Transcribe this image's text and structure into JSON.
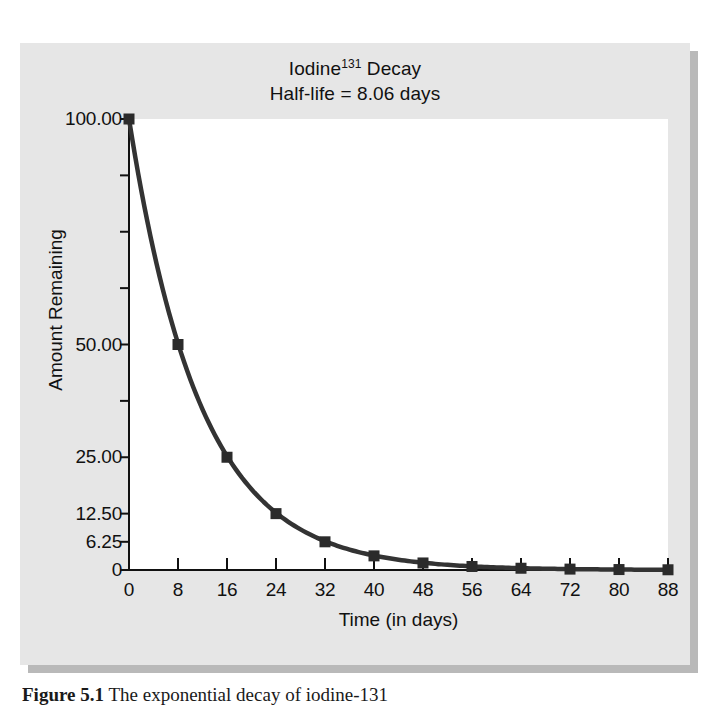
{
  "figure": {
    "caption_label": "Figure 5.1",
    "caption_text": "The exponential decay of iodine-131"
  },
  "chart_data": {
    "type": "line",
    "title": "Iodine131 Decay",
    "title_line1_base": "Iodine",
    "title_line1_sup": "131",
    "title_line1_tail": " Decay",
    "title_line2": "Half-life = 8.06 days",
    "xlabel": "Time (in days)",
    "ylabel": "Amount Remaining",
    "xlim": [
      0,
      88
    ],
    "ylim": [
      0,
      100
    ],
    "grid": false,
    "legend": "none",
    "marker": "square",
    "line_color": "#333333",
    "marker_color": "#2b2b2b",
    "background_color": "#ffffff",
    "panel_color": "#e6e6e6",
    "xticks": [
      0,
      8,
      16,
      24,
      32,
      40,
      48,
      56,
      64,
      72,
      80,
      88
    ],
    "xtick_labels": [
      "0",
      "8",
      "16",
      "24",
      "32",
      "40",
      "48",
      "56",
      "64",
      "72",
      "80",
      "88"
    ],
    "yticks": [
      0,
      6.25,
      12.5,
      25,
      37.5,
      50,
      62.5,
      75,
      87.5,
      100
    ],
    "ytick_labels": [
      {
        "value": 100,
        "label": "100.00"
      },
      {
        "value": 87.5,
        "label": ""
      },
      {
        "value": 75,
        "label": ""
      },
      {
        "value": 62.5,
        "label": ""
      },
      {
        "value": 50,
        "label": "50.00"
      },
      {
        "value": 37.5,
        "label": ""
      },
      {
        "value": 25,
        "label": "25.00"
      },
      {
        "value": 12.5,
        "label": "12.50"
      },
      {
        "value": 6.25,
        "label": "6.25"
      },
      {
        "value": 0,
        "label": "0"
      }
    ],
    "half_life_days": 8.06,
    "x": [
      0,
      8,
      16,
      24,
      32,
      40,
      48,
      56,
      64,
      72,
      80,
      88
    ],
    "values": [
      100.0,
      50.0,
      25.0,
      12.5,
      6.25,
      3.13,
      1.56,
      0.78,
      0.39,
      0.2,
      0.1,
      0.05
    ],
    "series": [
      {
        "name": "Amount Remaining",
        "x": [
          0,
          8,
          16,
          24,
          32,
          40,
          48,
          56,
          64,
          72,
          80,
          88
        ],
        "values": [
          100.0,
          50.0,
          25.0,
          12.5,
          6.25,
          3.13,
          1.56,
          0.78,
          0.39,
          0.2,
          0.1,
          0.05
        ]
      }
    ]
  }
}
